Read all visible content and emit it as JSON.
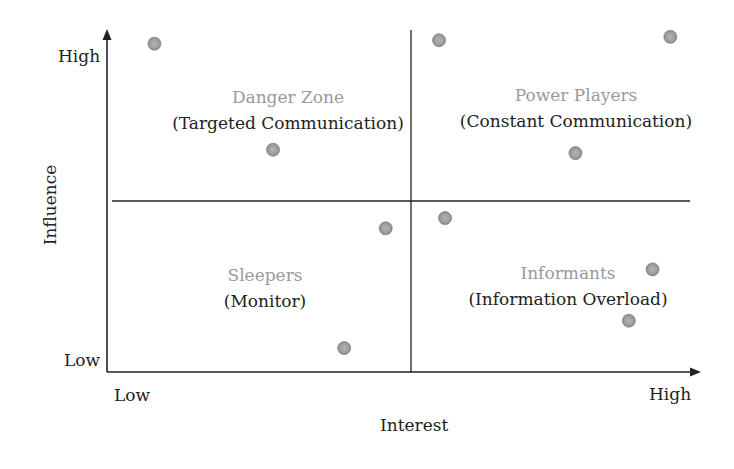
{
  "chart_data": {
    "type": "scatter",
    "title": "",
    "xlabel": "Interest",
    "ylabel": "Influence",
    "x_ticks": [
      "Low",
      "High"
    ],
    "y_ticks": [
      "Low",
      "High"
    ],
    "xlim": [
      0,
      10
    ],
    "ylim": [
      0,
      10
    ],
    "grid": false,
    "dividers": {
      "x": 5.1,
      "y": 5.0
    },
    "quadrants": [
      {
        "position": "top-left",
        "title": "Danger Zone",
        "subtitle": "(Targeted Communication)"
      },
      {
        "position": "top-right",
        "title": "Power Players",
        "subtitle": "(Constant Communication)"
      },
      {
        "position": "bottom-left",
        "title": "Sleepers",
        "subtitle": "(Monitor)"
      },
      {
        "position": "bottom-right",
        "title": "Informants",
        "subtitle": "(Information Overload)"
      }
    ],
    "points": [
      {
        "x": 0.8,
        "y": 9.6
      },
      {
        "x": 2.8,
        "y": 6.5
      },
      {
        "x": 5.6,
        "y": 9.7
      },
      {
        "x": 9.5,
        "y": 9.8
      },
      {
        "x": 7.9,
        "y": 6.4
      },
      {
        "x": 4.7,
        "y": 4.2
      },
      {
        "x": 5.7,
        "y": 4.5
      },
      {
        "x": 9.2,
        "y": 3.0
      },
      {
        "x": 8.8,
        "y": 1.5
      },
      {
        "x": 4.0,
        "y": 0.7
      }
    ],
    "point_color": "#9c9c9c"
  },
  "labels": {
    "y_high": "High",
    "y_low": "Low",
    "x_low": "Low",
    "x_high": "High",
    "x_axis_title": "Interest",
    "y_axis_title": "Influence",
    "q_tl_title": "Danger Zone",
    "q_tl_sub": "(Targeted Communication)",
    "q_tr_title": "Power Players",
    "q_tr_sub": "(Constant Communication)",
    "q_bl_title": "Sleepers",
    "q_bl_sub": "(Monitor)",
    "q_br_title": "Informants",
    "q_br_sub": "(Information Overload)"
  }
}
